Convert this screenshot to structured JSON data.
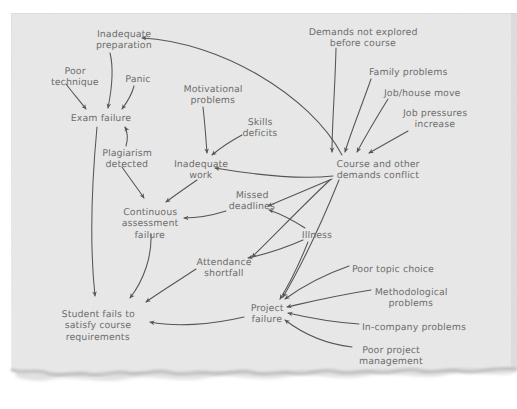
{
  "diagram": {
    "medium": "torn sheet of light grey paper, handwritten pencil",
    "colors": {
      "page_background": "#ffffff",
      "paper": "#e9e9e9",
      "paper_edge_shadow": "#b9b9b9",
      "ink": "#6d6d6d",
      "arrow": "#555555"
    },
    "nodes": [
      {
        "id": "inadequate-preparation",
        "label": "Inadequate\npreparation",
        "x": 92,
        "y": 29,
        "align": "center"
      },
      {
        "id": "poor-technique",
        "label": "Poor\ntechnique",
        "x": 51,
        "y": 66,
        "align": "center"
      },
      {
        "id": "panic",
        "label": "Panic",
        "x": 128,
        "y": 74,
        "align": "center"
      },
      {
        "id": "exam-failure",
        "label": "Exam failure",
        "x": 62,
        "y": 113,
        "align": "center"
      },
      {
        "id": "plagiarism-detected",
        "label": "Plagiarism\ndetected",
        "x": 99,
        "y": 148,
        "align": "center"
      },
      {
        "id": "motivational-problems",
        "label": "Motivational\nproblems",
        "x": 192,
        "y": 84,
        "align": "center"
      },
      {
        "id": "skills-deficits",
        "label": "Skills\ndeficits",
        "x": 243,
        "y": 117,
        "align": "center"
      },
      {
        "id": "inadequate-work",
        "label": "Inadequate\nwork",
        "x": 175,
        "y": 159,
        "align": "center"
      },
      {
        "id": "continuous-assessment-failure",
        "label": "Continuous\nassessment\nfailure",
        "x": 124,
        "y": 207,
        "align": "center"
      },
      {
        "id": "missed-deadlines",
        "label": "Missed\ndeadlines",
        "x": 228,
        "y": 190,
        "align": "center"
      },
      {
        "id": "illness",
        "label": "Illness",
        "x": 305,
        "y": 230,
        "align": "center"
      },
      {
        "id": "attendance-shortfall",
        "label": "Attendance\nshortfall",
        "x": 199,
        "y": 257,
        "align": "center"
      },
      {
        "id": "student-fails-to-satisfy-course-requirements",
        "label": "Student fails to\nsatisfy course\nrequirements",
        "x": 58,
        "y": 309,
        "align": "center"
      },
      {
        "id": "project-failure",
        "label": "Project\nfailure",
        "x": 251,
        "y": 303,
        "align": "center"
      },
      {
        "id": "demands-not-explored-before-course",
        "label": "Demands not explored\nbefore course",
        "x": 312,
        "y": 27,
        "align": "center"
      },
      {
        "id": "family-problems",
        "label": "Family problems",
        "x": 369,
        "y": 67,
        "align": "left"
      },
      {
        "id": "job-house-move",
        "label": "Job/house move",
        "x": 384,
        "y": 88,
        "align": "left"
      },
      {
        "id": "job-pressures-increase",
        "label": "Job pressures\nincrease",
        "x": 401,
        "y": 108,
        "align": "center"
      },
      {
        "id": "course-and-other-demands-conflict",
        "label": "Course and other\ndemands conflict",
        "x": 337,
        "y": 159,
        "align": "center"
      },
      {
        "id": "poor-topic-choice",
        "label": "Poor topic choice",
        "x": 352,
        "y": 264,
        "align": "left"
      },
      {
        "id": "methodological-problems",
        "label": "Methodological\nproblems",
        "x": 374,
        "y": 287,
        "align": "center"
      },
      {
        "id": "in-company-problems",
        "label": "In-company problems",
        "x": 362,
        "y": 322,
        "align": "left"
      },
      {
        "id": "poor-project-management",
        "label": "Poor project\nmanagement",
        "x": 355,
        "y": 345,
        "align": "center"
      }
    ],
    "edges": [
      {
        "id": "poor-technique-to-exam-failure",
        "from": "poor-technique",
        "to": "exam-failure"
      },
      {
        "id": "inadequate-preparation-to-exam-failure",
        "from": "inadequate-preparation",
        "to": "exam-failure"
      },
      {
        "id": "panic-to-exam-failure",
        "from": "panic",
        "to": "exam-failure"
      },
      {
        "id": "plagiarism-detected-to-exam-failure",
        "from": "plagiarism-detected",
        "to": "exam-failure"
      },
      {
        "id": "plagiarism-detected-to-continuous-assessment-failure",
        "from": "plagiarism-detected",
        "to": "continuous-assessment-failure"
      },
      {
        "id": "exam-failure-to-student-fails",
        "from": "exam-failure",
        "to": "student-fails-to-satisfy-course-requirements"
      },
      {
        "id": "motivational-problems-to-inadequate-work",
        "from": "motivational-problems",
        "to": "inadequate-work"
      },
      {
        "id": "skills-deficits-to-inadequate-work",
        "from": "skills-deficits",
        "to": "inadequate-work"
      },
      {
        "id": "inadequate-work-to-continuous-assessment-failure",
        "from": "inadequate-work",
        "to": "continuous-assessment-failure"
      },
      {
        "id": "continuous-assessment-failure-to-student-fails",
        "from": "continuous-assessment-failure",
        "to": "student-fails-to-satisfy-course-requirements"
      },
      {
        "id": "missed-deadlines-to-continuous-assessment-failure",
        "from": "missed-deadlines",
        "to": "continuous-assessment-failure"
      },
      {
        "id": "illness-to-missed-deadlines",
        "from": "illness",
        "to": "missed-deadlines"
      },
      {
        "id": "illness-to-attendance-shortfall",
        "from": "illness",
        "to": "attendance-shortfall"
      },
      {
        "id": "illness-to-project-failure",
        "from": "illness",
        "to": "project-failure"
      },
      {
        "id": "attendance-shortfall-to-student-fails",
        "from": "attendance-shortfall",
        "to": "student-fails-to-satisfy-course-requirements"
      },
      {
        "id": "project-failure-to-student-fails",
        "from": "project-failure",
        "to": "student-fails-to-satisfy-course-requirements"
      },
      {
        "id": "demands-not-explored-to-course-conflict",
        "from": "demands-not-explored-before-course",
        "to": "course-and-other-demands-conflict"
      },
      {
        "id": "family-problems-to-course-conflict",
        "from": "family-problems",
        "to": "course-and-other-demands-conflict"
      },
      {
        "id": "job-house-move-to-course-conflict",
        "from": "job-house-move",
        "to": "course-and-other-demands-conflict"
      },
      {
        "id": "job-pressures-increase-to-course-conflict",
        "from": "job-pressures-increase",
        "to": "course-and-other-demands-conflict"
      },
      {
        "id": "course-conflict-to-inadequate-preparation",
        "from": "course-and-other-demands-conflict",
        "to": "inadequate-preparation"
      },
      {
        "id": "course-conflict-to-inadequate-work",
        "from": "course-and-other-demands-conflict",
        "to": "inadequate-work"
      },
      {
        "id": "course-conflict-to-missed-deadlines",
        "from": "course-and-other-demands-conflict",
        "to": "missed-deadlines"
      },
      {
        "id": "course-conflict-to-attendance-shortfall",
        "from": "course-and-other-demands-conflict",
        "to": "attendance-shortfall"
      },
      {
        "id": "course-conflict-to-project-failure",
        "from": "course-and-other-demands-conflict",
        "to": "project-failure"
      },
      {
        "id": "poor-topic-choice-to-project-failure",
        "from": "poor-topic-choice",
        "to": "project-failure"
      },
      {
        "id": "methodological-problems-to-project-failure",
        "from": "methodological-problems",
        "to": "project-failure"
      },
      {
        "id": "in-company-problems-to-project-failure",
        "from": "in-company-problems",
        "to": "project-failure"
      },
      {
        "id": "poor-project-management-to-project-failure",
        "from": "poor-project-management",
        "to": "project-failure"
      }
    ],
    "edge_paths": {
      "poor-technique-to-exam-failure": "M66,84 C72,92 79,100 86,109",
      "inadequate-preparation-to-exam-failure": "M110,53 C114,69 112,88 108,108",
      "panic-to-exam-failure": "M134,86 C132,94 128,101 122,109",
      "plagiarism-detected-to-exam-failure": "M126,146 C128,139 128,133 125,127",
      "plagiarism-detected-to-continuous-assessment-failure": "M122,167 C131,180 138,189 144,198",
      "exam-failure-to-student-fails": "M97,127 C93,170 89,240 95,296",
      "motivational-problems-to-inadequate-work": "M203,107 C205,124 206,140 207,153",
      "skills-deficits-to-inadequate-work": "M242,135 C229,142 219,149 212,155",
      "inadequate-work-to-continuous-assessment-failure": "M197,180 C184,189 174,196 166,202",
      "continuous-assessment-failure-to-student-fails": "M151,234 C152,256 144,280 130,298",
      "missed-deadlines-to-continuous-assessment-failure": "M226,211 C210,216 196,218 184,218",
      "illness-to-missed-deadlines": "M305,228 C294,221 281,214 269,210",
      "illness-to-attendance-shortfall": "M303,240 C285,248 266,254 248,258",
      "illness-to-project-failure": "M308,242 C300,262 290,283 280,299",
      "attendance-shortfall-to-student-fails": "M196,269 C178,281 160,292 146,302",
      "project-failure-to-student-fails": "M244,317 C210,325 175,327 150,322",
      "demands-not-explored-to-course-conflict": "M336,48 C335,90 332,125 332,152",
      "family-problems-to-course-conflict": "M371,79 C362,105 351,132 345,152",
      "job-house-move-to-course-conflict": "M388,99 C375,120 364,139 357,152",
      "job-pressures-increase-to-course-conflict": "M408,131 C392,140 378,148 369,153",
      "course-conflict-to-inadequate-preparation": "M342,155 C310,95 220,42 142,38",
      "course-conflict-to-inadequate-work": "M333,176 C295,180 250,174 215,168",
      "course-conflict-to-missed-deadlines": "M332,179 C306,190 285,199 268,206",
      "course-conflict-to-attendance-shortfall": "M330,180 C300,208 272,238 252,257",
      "course-conflict-to-project-failure": "M339,180 C322,222 300,268 283,297",
      "poor-topic-choice-to-project-failure": "M349,266 C326,274 303,286 285,299",
      "methodological-problems-to-project-failure": "M371,290 C333,296 305,303 287,307",
      "in-company-problems-to-project-failure": "M359,324 C330,322 305,317 288,313",
      "poor-project-management-to-project-failure": "M352,347 C326,344 302,333 285,320"
    }
  }
}
